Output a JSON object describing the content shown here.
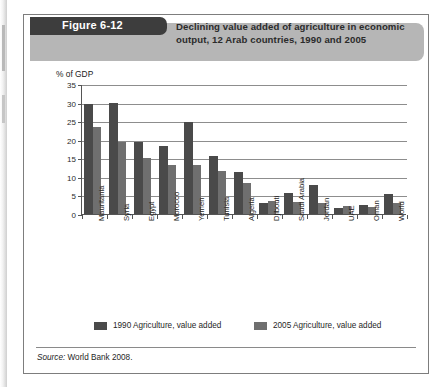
{
  "figure": {
    "tag": "Figure 6-12",
    "title": "Declining value added of agriculture in economic output, 12 Arab countries, 1990 and 2005",
    "source_label": "Source:",
    "source_text": "World Bank 2008."
  },
  "legend": {
    "items": [
      {
        "label": "1990 Agriculture, value added",
        "color": "#4a4a4a"
      },
      {
        "label": "2005 Agriculture, value added",
        "color": "#6f6f6f"
      }
    ]
  },
  "chart_data": {
    "type": "bar",
    "title": "Declining value added of agriculture in economic output, 12 Arab countries, 1990 and 2005",
    "xlabel": "",
    "ylabel": "% of GDP",
    "ylim": [
      0,
      35
    ],
    "yticks": [
      0,
      5,
      10,
      15,
      20,
      25,
      30,
      35
    ],
    "grid": true,
    "legend_position": "bottom",
    "categories": [
      "Mauritania",
      "Syria",
      "Egypt",
      "Morocco",
      "Yemen",
      "Tunisia",
      "Algeria",
      "Djibouti",
      "Saudi Arabia",
      "Jordan",
      "UAE",
      "Oman",
      "World"
    ],
    "series": [
      {
        "name": "1990 Agriculture, value added",
        "color": "#4a4a4a",
        "values": [
          29.5,
          30.0,
          19.5,
          18.2,
          24.8,
          15.7,
          11.2,
          3.0,
          5.6,
          7.9,
          1.6,
          2.4,
          5.4
        ]
      },
      {
        "name": "2005 Agriculture, value added",
        "color": "#6f6f6f",
        "values": [
          23.5,
          19.5,
          15.0,
          13.2,
          13.2,
          11.5,
          8.3,
          3.4,
          3.2,
          3.0,
          2.1,
          1.8,
          3.0
        ]
      }
    ]
  }
}
